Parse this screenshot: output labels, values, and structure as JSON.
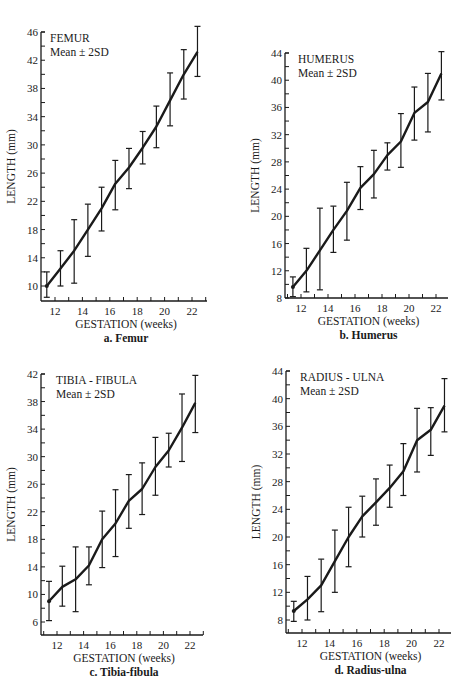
{
  "chart_data": [
    {
      "id": "a",
      "type": "line",
      "title": "FEMUR",
      "subtitle": "Mean ± 2SD",
      "caption": "a. Femur",
      "xlabel": "GESTATION (weeks)",
      "ylabel": "LENGTH (mm)",
      "xticks": [
        12,
        14,
        16,
        18,
        20,
        22
      ],
      "yticks": [
        10,
        14,
        18,
        22,
        26,
        30,
        34,
        38,
        42,
        46
      ],
      "xlim": [
        11,
        23
      ],
      "ylim": [
        8.2,
        46
      ],
      "error_bars": "mean ± 2SD",
      "x": [
        11.4,
        12.4,
        13.4,
        14.4,
        15.4,
        16.4,
        17.4,
        18.4,
        19.4,
        20.4,
        21.4,
        22.4
      ],
      "series": [
        {
          "name": "Mean",
          "values": [
            10,
            12.5,
            15,
            18,
            21,
            24.5,
            26.8,
            29.6,
            32.6,
            36.3,
            40,
            43.2
          ]
        },
        {
          "name": "Mean - 2SD",
          "values": [
            8.4,
            10,
            10.4,
            14.2,
            17.8,
            20.8,
            23.8,
            27.3,
            29.6,
            32.7,
            36.5,
            39.7
          ]
        },
        {
          "name": "Mean + 2SD",
          "values": [
            12,
            15,
            19.4,
            21.6,
            24,
            27.8,
            29.5,
            31.9,
            35.5,
            40.2,
            43.5,
            46.8
          ]
        }
      ]
    },
    {
      "id": "b",
      "type": "line",
      "title": "HUMERUS",
      "subtitle": "Mean ± 2SD",
      "caption": "b. Humerus",
      "xlabel": "GESTATION (weeks)",
      "ylabel": "LENGTH (mm)",
      "xticks": [
        12,
        14,
        16,
        18,
        20,
        22
      ],
      "yticks": [
        8,
        12,
        16,
        20,
        24,
        28,
        32,
        36,
        40,
        44
      ],
      "xlim": [
        11,
        23
      ],
      "ylim": [
        8,
        44
      ],
      "error_bars": "mean ± 2SD",
      "x": [
        11.4,
        12.4,
        13.4,
        14.4,
        15.4,
        16.4,
        17.4,
        18.4,
        19.4,
        20.4,
        21.4,
        22.4
      ],
      "series": [
        {
          "name": "Mean",
          "values": [
            9.6,
            12,
            15,
            18,
            20.8,
            24.2,
            26.2,
            29,
            31,
            35.2,
            36.8,
            41
          ]
        },
        {
          "name": "Mean - 2SD",
          "values": [
            8.2,
            8.9,
            9.2,
            14.7,
            16.5,
            21,
            22.7,
            26.8,
            27.2,
            31.2,
            32.4,
            37.1
          ]
        },
        {
          "name": "Mean + 2SD",
          "values": [
            11.1,
            15.3,
            21.2,
            21.5,
            25,
            27.3,
            29.7,
            30.8,
            35.1,
            39,
            41,
            44.2
          ]
        }
      ]
    },
    {
      "id": "c",
      "type": "line",
      "title": "TIBIA - FIBULA",
      "subtitle": "Mean ± 2SD",
      "caption": "c. Tibia-fibula",
      "xlabel": "GESTATION (weeks)",
      "ylabel": "LENGTH (mm)",
      "xticks": [
        12,
        14,
        16,
        18,
        20,
        22
      ],
      "yticks": [
        6,
        10,
        14,
        18,
        22,
        26,
        30,
        34,
        38,
        42
      ],
      "xlim": [
        11,
        23
      ],
      "ylim": [
        5.2,
        42
      ],
      "error_bars": "mean ± 2SD",
      "x": [
        11.4,
        12.4,
        13.4,
        14.4,
        15.4,
        16.4,
        17.4,
        18.4,
        19.4,
        20.4,
        21.4,
        22.4
      ],
      "series": [
        {
          "name": "Mean",
          "values": [
            9,
            11.1,
            12.2,
            14.2,
            18,
            20.3,
            23.6,
            25.3,
            28.5,
            30.9,
            34.2,
            37.8
          ]
        },
        {
          "name": "Mean - 2SD",
          "values": [
            6.2,
            8.3,
            7.5,
            11.4,
            13.9,
            15.5,
            19.6,
            21.6,
            24.4,
            28.5,
            29.3,
            33.5
          ]
        },
        {
          "name": "Mean + 2SD",
          "values": [
            11.9,
            14.1,
            16.9,
            16.9,
            22.1,
            25.2,
            27.4,
            29.1,
            32.8,
            33.4,
            39.1,
            41.8
          ]
        }
      ]
    },
    {
      "id": "d",
      "type": "line",
      "title": "RADIUS - ULNA",
      "subtitle": "Mean ± 2SD",
      "caption": "d. Radius-ulna",
      "xlabel": "GESTATION (weeks)",
      "ylabel": "LENGTH (mm)",
      "xticks": [
        12,
        14,
        16,
        18,
        20,
        22
      ],
      "yticks": [
        8,
        12,
        16,
        20,
        24,
        28,
        32,
        36,
        40,
        44
      ],
      "xlim": [
        11,
        23
      ],
      "ylim": [
        7,
        44
      ],
      "error_bars": "mean ± 2SD",
      "x": [
        11.4,
        12.4,
        13.4,
        14.4,
        15.4,
        16.4,
        17.4,
        18.4,
        19.4,
        20.4,
        21.4,
        22.4
      ],
      "series": [
        {
          "name": "Mean",
          "values": [
            9.3,
            11,
            13,
            16.5,
            20,
            23,
            25,
            27.1,
            29.5,
            34,
            35.5,
            39
          ]
        },
        {
          "name": "Mean - 2SD",
          "values": [
            7.8,
            8,
            9.2,
            12,
            15.7,
            20,
            21.7,
            24.3,
            26,
            29.4,
            31.8,
            35.2
          ]
        },
        {
          "name": "Mean + 2SD",
          "values": [
            10.7,
            14.3,
            16.8,
            21,
            24.3,
            25.9,
            28.4,
            30.4,
            33.5,
            38.6,
            38.7,
            42.9
          ]
        }
      ]
    }
  ],
  "layout": [
    {
      "left": 41,
      "top": 32,
      "right": 207,
      "bottom": 301,
      "ytop_val": 46,
      "ytop_px": 32,
      "ybot_val": 10,
      "ybot_px": 286,
      "x12": 55,
      "x22": 192,
      "title_x": 50,
      "title_y": 37
    },
    {
      "left": 285,
      "top": 53,
      "right": 448,
      "bottom": 298,
      "ytop_val": 44,
      "ytop_px": 53,
      "ybot_val": 8,
      "ybot_px": 298,
      "x12": 301,
      "x22": 436,
      "title_x": 298,
      "title_y": 58
    },
    {
      "left": 41,
      "top": 374,
      "right": 203,
      "bottom": 635,
      "ytop_val": 42,
      "ytop_px": 374,
      "ybot_val": 6,
      "ybot_px": 622,
      "x12": 57,
      "x22": 190,
      "title_x": 56,
      "title_y": 379
    },
    {
      "left": 286,
      "top": 371,
      "right": 451,
      "bottom": 633,
      "ytop_val": 44,
      "ytop_px": 371,
      "ybot_val": 8,
      "ybot_px": 620,
      "x12": 302,
      "x22": 439,
      "title_x": 300,
      "title_y": 376
    }
  ]
}
